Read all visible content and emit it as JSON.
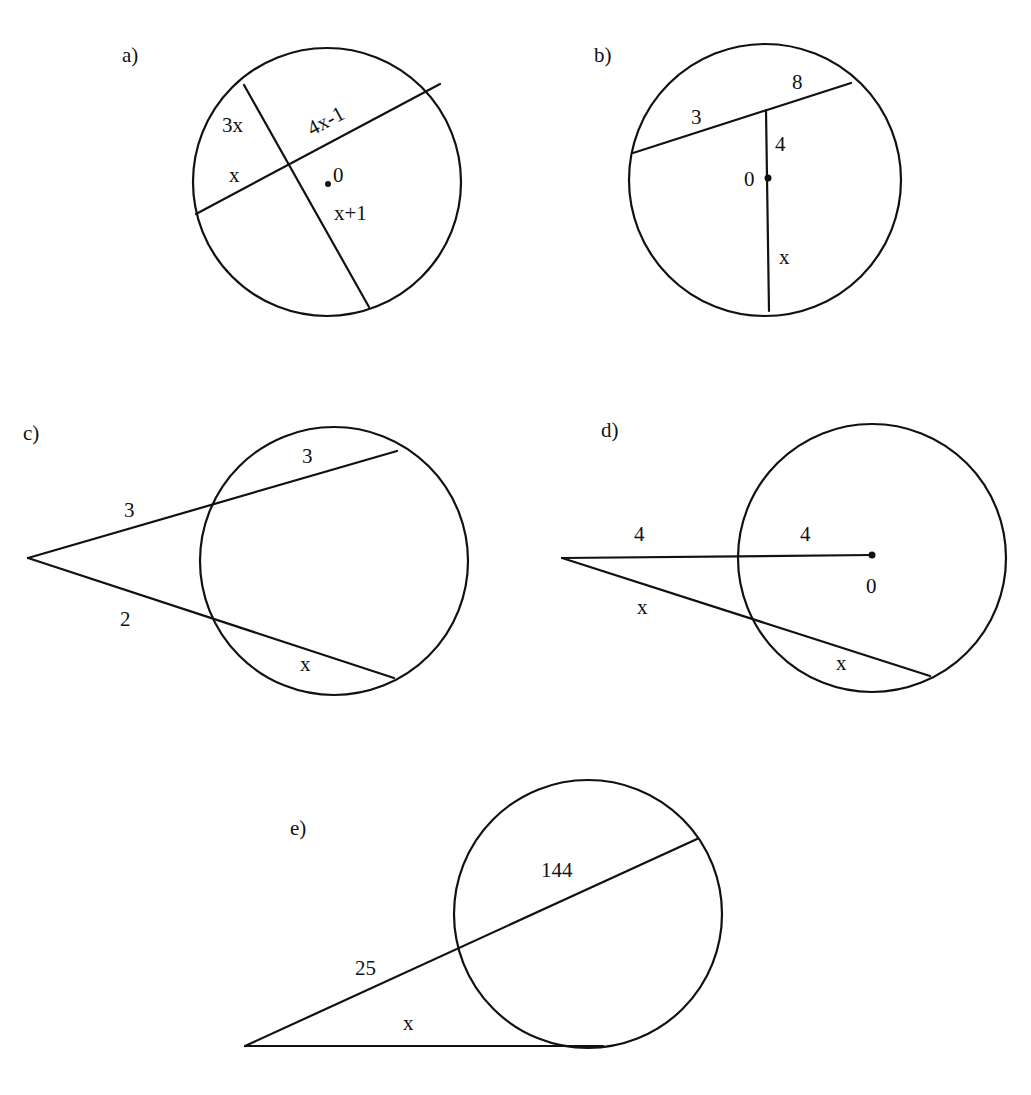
{
  "stroke_color": "#111111",
  "background_color": "#ffffff",
  "figures": {
    "a": {
      "label": "a)",
      "circle": {
        "cx": 327,
        "cy": 182,
        "r": 134
      },
      "chords": [
        {
          "x1": 196,
          "y1": 214,
          "x2": 440,
          "y2": 84
        },
        {
          "x1": 244,
          "y1": 85,
          "x2": 369,
          "y2": 307
        }
      ],
      "center_dot": {
        "x": 328,
        "y": 184
      },
      "center_label": "0",
      "segment_labels": {
        "upper_left": "3x",
        "lower_left": "x",
        "upper_right": "4x-1",
        "lower_right": "x+1"
      }
    },
    "b": {
      "label": "b)",
      "circle": {
        "cx": 765,
        "cy": 180,
        "r": 136
      },
      "chords": [
        {
          "x1": 633,
          "y1": 153,
          "x2": 851,
          "y2": 83
        },
        {
          "x1": 766,
          "y1": 110,
          "x2": 769,
          "y2": 311
        }
      ],
      "center_dot": {
        "x": 768,
        "y": 178
      },
      "center_label": "0",
      "segment_labels": {
        "chord_left": "3",
        "chord_right": "8",
        "upper_vertical": "4",
        "lower_vertical": "x"
      }
    },
    "c": {
      "label": "c)",
      "circle": {
        "cx": 334,
        "cy": 561,
        "r": 134
      },
      "vertex": {
        "x": 28,
        "y": 558
      },
      "secants": [
        {
          "x2": 397,
          "y2": 451
        },
        {
          "x2": 394,
          "y2": 678
        }
      ],
      "segment_labels": {
        "upper_external": "3",
        "upper_internal": "3",
        "lower_external": "2",
        "lower_internal": "x"
      }
    },
    "d": {
      "label": "d)",
      "circle": {
        "cx": 872,
        "cy": 558,
        "r": 134
      },
      "vertex": {
        "x": 562,
        "y": 558
      },
      "radius_line": {
        "x2": 872,
        "y2": 555
      },
      "secant": {
        "x2": 930,
        "y2": 676
      },
      "center_dot": {
        "x": 872,
        "y": 555
      },
      "center_label": "0",
      "segment_labels": {
        "upper_external": "4",
        "upper_internal": "4",
        "lower_external": "x",
        "lower_internal": "x"
      }
    },
    "e": {
      "label": "e)",
      "circle": {
        "cx": 588,
        "cy": 914,
        "r": 134
      },
      "vertex": {
        "x": 245,
        "y": 1046
      },
      "secant": {
        "x2": 697,
        "y2": 839
      },
      "tangent": {
        "x2": 603,
        "y2": 1046
      },
      "segment_labels": {
        "external": "25",
        "internal": "144",
        "tangent": "x"
      }
    }
  }
}
